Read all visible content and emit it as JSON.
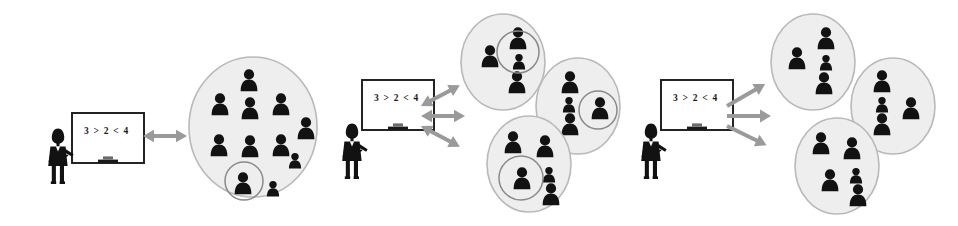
{
  "diagram": {
    "background_color": "#ffffff",
    "figure_color": "#121212",
    "cluster_fill": "#eeeeee",
    "cluster_stroke": "#b9b9b9",
    "highlight_stroke": "#8a8a8a",
    "arrow_color": "#9a9a9a",
    "board_frame_color": "#1a1a1a",
    "board_fill_color": "#ffffff",
    "panels": [
      {
        "id": "panel-whole-class",
        "name": "whole-class-instruction",
        "teacher": {
          "name": "teacher-figure-1",
          "board_text": "3 > 2 < 4"
        },
        "arrow": {
          "name": "arrow-bidirectional-class",
          "style": "double-headed",
          "label": ""
        },
        "groups": [
          {
            "name": "whole-class-group",
            "members": 11,
            "highlighted_members": 1,
            "has_highlight_circle": true
          }
        ]
      },
      {
        "id": "panel-group-work-interactive",
        "name": "small-group-interactive",
        "teacher": {
          "name": "teacher-figure-2",
          "board_text": "3 > 2 < 4"
        },
        "arrow": {
          "name": "arrows-bidirectional-groups",
          "style": "double-headed",
          "count": 3,
          "label": ""
        },
        "groups": [
          {
            "name": "group-a",
            "members": 4,
            "highlighted_members": 2,
            "has_highlight_circle": true
          },
          {
            "name": "group-b",
            "members": 4,
            "highlighted_members": 2,
            "has_highlight_circle": true
          },
          {
            "name": "group-c",
            "members": 4,
            "highlighted_members": 2,
            "has_highlight_circle": true
          }
        ]
      },
      {
        "id": "panel-group-work-oneway",
        "name": "small-group-one-way",
        "teacher": {
          "name": "teacher-figure-3",
          "board_text": "3 > 2 < 4"
        },
        "arrow": {
          "name": "arrows-one-way-groups",
          "style": "single-headed",
          "count": 3,
          "label": ""
        },
        "groups": [
          {
            "name": "group-d",
            "members": 4,
            "highlighted_members": 0,
            "has_highlight_circle": false
          },
          {
            "name": "group-e",
            "members": 4,
            "highlighted_members": 0,
            "has_highlight_circle": false
          },
          {
            "name": "group-f",
            "members": 4,
            "highlighted_members": 0,
            "has_highlight_circle": false
          }
        ]
      }
    ]
  }
}
